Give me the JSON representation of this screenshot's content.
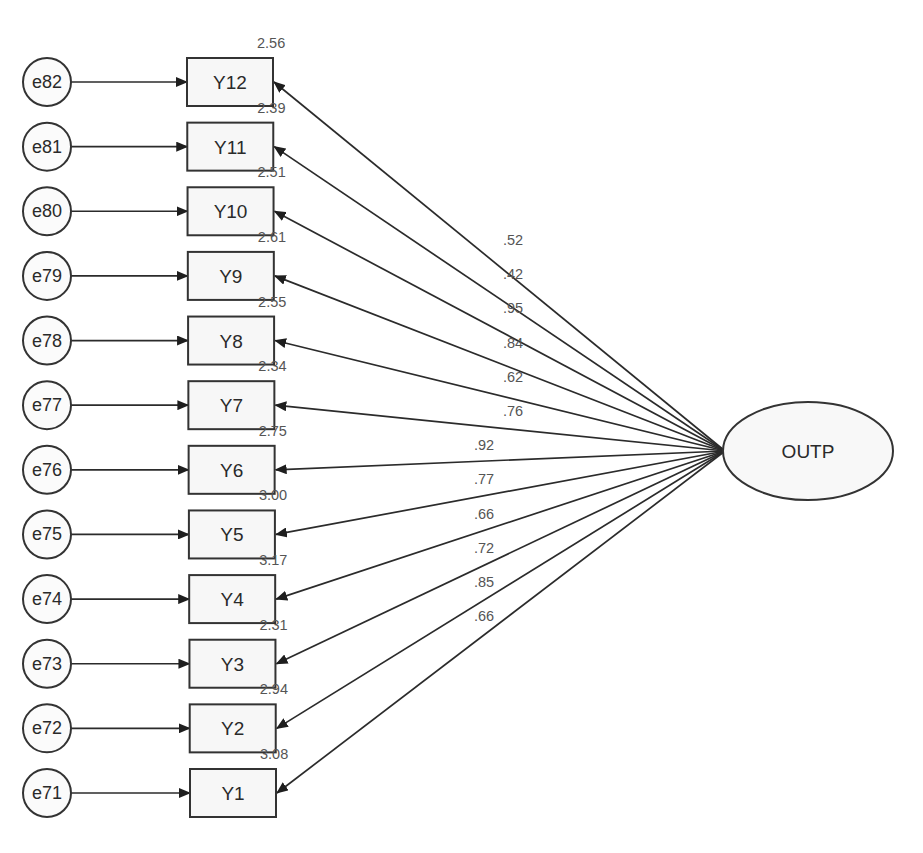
{
  "diagram": {
    "type": "SEM path diagram (confirmatory factor analysis)",
    "latent": {
      "label": "OUTP"
    },
    "indicators": [
      {
        "label": "Y12",
        "error": "e82",
        "intercept": "2.56",
        "loading": ".52"
      },
      {
        "label": "Y11",
        "error": "e81",
        "intercept": "2.39",
        "loading": ".42"
      },
      {
        "label": "Y10",
        "error": "e80",
        "intercept": "2.51",
        "loading": ".95"
      },
      {
        "label": "Y9",
        "error": "e79",
        "intercept": "2.61",
        "loading": ".84"
      },
      {
        "label": "Y8",
        "error": "e78",
        "intercept": "2.55",
        "loading": ".62"
      },
      {
        "label": "Y7",
        "error": "e77",
        "intercept": "2.34",
        "loading": ".76"
      },
      {
        "label": "Y6",
        "error": "e76",
        "intercept": "2.75",
        "loading": ".92"
      },
      {
        "label": "Y5",
        "error": "e75",
        "intercept": "3.00",
        "loading": ".77"
      },
      {
        "label": "Y4",
        "error": "e74",
        "intercept": "3.17",
        "loading": ".66"
      },
      {
        "label": "Y3",
        "error": "e73",
        "intercept": "2.31",
        "loading": ".72"
      },
      {
        "label": "Y2",
        "error": "e72",
        "intercept": "2.94",
        "loading": ".85"
      },
      {
        "label": "Y1",
        "error": "e71",
        "intercept": "3.08",
        "loading": ".66"
      }
    ]
  },
  "colors": {
    "stroke": "#333333",
    "node_fill": "#f7f7f7",
    "text": "#2a2a2a",
    "coefficient_text": "#555555"
  }
}
